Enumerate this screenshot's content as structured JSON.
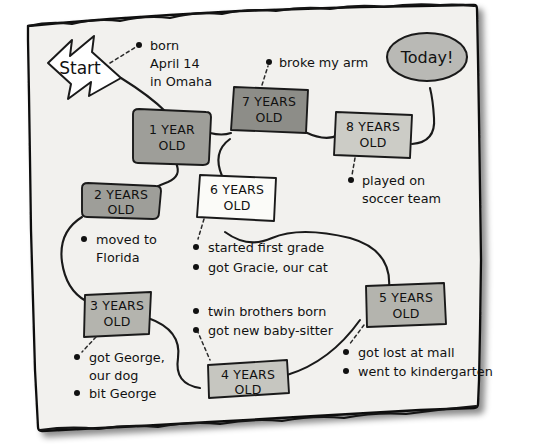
{
  "page": {
    "paper_color": "#f2f1ee",
    "ink_color": "#1a1a1a",
    "background_color": "#ffffff"
  },
  "start_marker": {
    "label": "Start",
    "shape": "arrow-right",
    "fill": "#ffffff"
  },
  "end_marker": {
    "label": "Today!",
    "shape": "ellipse",
    "fill": "#b9b9b5"
  },
  "nodes": [
    {
      "id": "n1",
      "label_line1": "1 YEAR",
      "label_line2": "OLD",
      "fill": "#9e9e99",
      "shape": "rounded"
    },
    {
      "id": "n2",
      "label_line1": "2 YEARS",
      "label_line2": "OLD",
      "fill": "#9e9e99",
      "shape": "rounded"
    },
    {
      "id": "n3",
      "label_line1": "3 YEARS",
      "label_line2": "OLD",
      "fill": "#b4b4ae",
      "shape": "rect"
    },
    {
      "id": "n4",
      "label_line1": "4 YEARS",
      "label_line2": "OLD",
      "fill": "#c6c6c0",
      "shape": "rect"
    },
    {
      "id": "n5",
      "label_line1": "5 YEARS",
      "label_line2": "OLD",
      "fill": "#b4b4ae",
      "shape": "rect"
    },
    {
      "id": "n6",
      "label_line1": "6 YEARS",
      "label_line2": "OLD",
      "fill": "#fbfbf8",
      "shape": "rect"
    },
    {
      "id": "n7",
      "label_line1": "7 YEARS",
      "label_line2": "OLD",
      "fill": "#8d8d88",
      "shape": "rect"
    },
    {
      "id": "n8",
      "label_line1": "8 YEARS",
      "label_line2": "OLD",
      "fill": "#ccccc6",
      "shape": "rect"
    }
  ],
  "notes": {
    "birth": {
      "lines": [
        "born",
        "April 14",
        "in Omaha"
      ],
      "bulleted": false
    },
    "year2": {
      "lines": [
        "moved to",
        "Florida"
      ],
      "bulleted": true
    },
    "year3": {
      "lines": [
        "got George,",
        "our dog",
        "bit George"
      ],
      "bulleted": true
    },
    "year5": {
      "lines": [
        "got lost at mall",
        "went to kindergarten"
      ],
      "bulleted": true
    },
    "year6": {
      "lines": [
        "started first grade",
        "got Gracie, our cat"
      ],
      "bulleted": true
    },
    "year4": {
      "lines": [
        "twin brothers born",
        "got new baby-sitter"
      ],
      "bulleted": true
    },
    "year7": {
      "lines": [
        "broke my arm"
      ],
      "bulleted": false
    },
    "year8": {
      "lines": [
        "played on",
        "soccer team"
      ],
      "bulleted": false
    }
  }
}
